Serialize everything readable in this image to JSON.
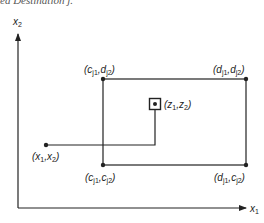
{
  "caption": "ed Destination j.",
  "axes": {
    "x_label": "x",
    "x_sub": "1",
    "y_label": "x",
    "y_sub": "2"
  },
  "rectangle": {
    "top_left": {
      "label": "(c",
      "sub1": "j1",
      "mid": ",d",
      "sub2": "j2",
      "end": ")"
    },
    "top_right": {
      "label": "(d",
      "sub1": "j1",
      "mid": ",d",
      "sub2": "j2",
      "end": ")"
    },
    "bottom_left": {
      "label": "(c",
      "sub1": "j1",
      "mid": ",c",
      "sub2": "j2",
      "end": ")"
    },
    "bottom_right": {
      "label": "(d",
      "sub1": "j1",
      "mid": ",c",
      "sub2": "j2",
      "end": ")"
    }
  },
  "origin_point": {
    "label": "(x",
    "sub1": "1",
    "mid": ",x",
    "sub2": "2",
    "end": ")"
  },
  "target_point": {
    "label": "(z",
    "sub1": "1",
    "mid": ",z",
    "sub2": "2",
    "end": ")"
  },
  "colors": {
    "line": "#222222",
    "background": "#ffffff"
  }
}
